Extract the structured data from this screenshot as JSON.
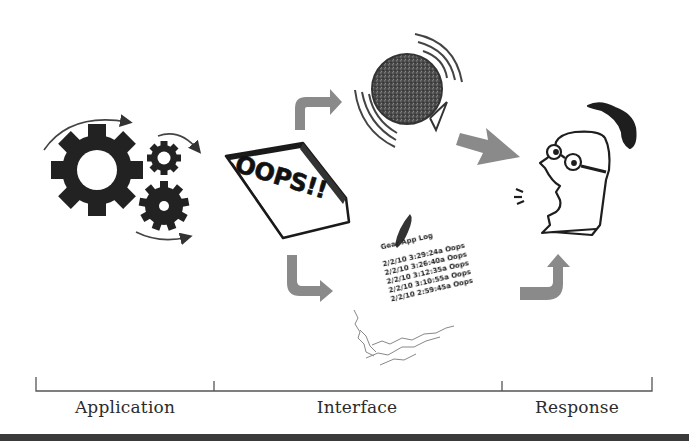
{
  "diagram": {
    "stages": [
      {
        "id": "application",
        "label": "Application",
        "icon": "gears-icon"
      },
      {
        "id": "interface",
        "label": "Interface",
        "icon": "error-dialog-icon"
      },
      {
        "id": "response",
        "label": "Response",
        "icon": "surprised-person-icon"
      }
    ],
    "error_popup": {
      "text": "OOPS!!"
    },
    "spinning_ball": {
      "icon": "spinning-wait-ball-icon"
    },
    "log": {
      "title": "Gear App Log",
      "entries": [
        "2/2/10 3:29:24a Oops",
        "2/2/10 3:26:40a Oops",
        "2/2/10 3:12:35a Oops",
        "2/2/10 3:10:55a Oops",
        "2/2/10 2:59:45a Oops"
      ]
    },
    "arrows": [
      {
        "from": "error_popup",
        "to": "spinning_ball",
        "icon": "curved-arrow-up-right-icon"
      },
      {
        "from": "spinning_ball",
        "to": "person",
        "icon": "arrow-right-icon"
      },
      {
        "from": "error_popup",
        "to": "log",
        "icon": "curved-arrow-down-right-icon"
      },
      {
        "from": "log",
        "to": "person",
        "icon": "curved-arrow-up-icon"
      }
    ],
    "colors": {
      "arrow": "#8a8a8a",
      "ink": "#1e1e1e",
      "timeline": "#555555",
      "bottom_bar": "#3a3a3a"
    }
  }
}
